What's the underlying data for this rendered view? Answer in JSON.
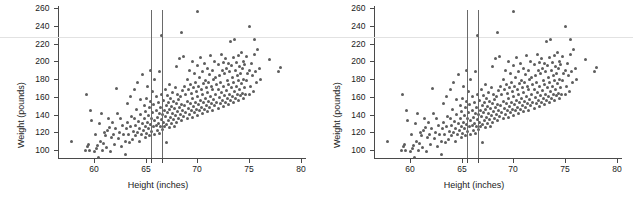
{
  "figure": {
    "width": 633,
    "height": 204,
    "background": "#ffffff",
    "page_rule": {
      "y_value": 227,
      "color": "#e2e2e2"
    }
  },
  "panels": [
    {
      "name": "panel-left",
      "x_offset": 0
    },
    {
      "name": "panel-right",
      "x_offset": 316
    }
  ],
  "chart_data": {
    "type": "scatter",
    "title": "",
    "xlabel": "Height (inches)",
    "ylabel": "Weight (pounds)",
    "xlim": [
      56.8,
      80.5
    ],
    "ylim": [
      88,
      266
    ],
    "xticks": [
      60,
      65,
      70,
      75,
      80
    ],
    "xticklabels": [
      "60",
      "65",
      "70",
      "75",
      "80"
    ],
    "yticks": [
      100,
      120,
      140,
      160,
      180,
      200,
      220,
      240,
      260
    ],
    "yticklabels": [
      "100",
      "120",
      "140",
      "160",
      "180",
      "200",
      "220",
      "240",
      "260"
    ],
    "grid": false,
    "legend": null,
    "marker_color": "#5d5d5d",
    "marker_size_px": 3,
    "annotations": [
      {
        "type": "vline",
        "x": 65.5,
        "color": "#6a6a6a",
        "label": "reference line 65.5 in"
      },
      {
        "type": "vline",
        "x": 66.6,
        "color": "#6a6a6a",
        "label": "reference line 66.6 in"
      },
      {
        "type": "hline",
        "y": 227,
        "color": "#e2e2e2",
        "label": "page rule"
      }
    ],
    "n_points": 300,
    "points": [
      [
        57.8,
        110
      ],
      [
        59.2,
        100
      ],
      [
        59.3,
        162
      ],
      [
        59.4,
        104
      ],
      [
        59.5,
        106
      ],
      [
        59.6,
        99
      ],
      [
        59.7,
        144
      ],
      [
        59.8,
        133
      ],
      [
        60.0,
        98
      ],
      [
        60.1,
        118
      ],
      [
        60.2,
        102
      ],
      [
        60.3,
        105
      ],
      [
        60.4,
        92
      ],
      [
        60.5,
        130
      ],
      [
        60.6,
        110
      ],
      [
        60.7,
        141
      ],
      [
        60.8,
        100
      ],
      [
        60.9,
        107
      ],
      [
        61.0,
        120
      ],
      [
        61.1,
        116
      ],
      [
        61.2,
        103
      ],
      [
        61.3,
        122
      ],
      [
        61.4,
        136
      ],
      [
        61.5,
        125
      ],
      [
        61.6,
        98
      ],
      [
        61.7,
        114
      ],
      [
        61.8,
        131
      ],
      [
        61.9,
        118
      ],
      [
        62.0,
        106
      ],
      [
        62.1,
        124
      ],
      [
        62.2,
        169
      ],
      [
        62.3,
        141
      ],
      [
        62.4,
        113
      ],
      [
        62.5,
        120
      ],
      [
        62.6,
        135
      ],
      [
        62.7,
        104
      ],
      [
        62.8,
        128
      ],
      [
        62.9,
        117
      ],
      [
        63.0,
        95
      ],
      [
        63.0,
        110
      ],
      [
        63.1,
        124
      ],
      [
        63.2,
        131
      ],
      [
        63.2,
        152
      ],
      [
        63.3,
        118
      ],
      [
        63.4,
        108
      ],
      [
        63.5,
        126
      ],
      [
        63.5,
        160
      ],
      [
        63.6,
        138
      ],
      [
        63.7,
        112
      ],
      [
        63.8,
        121
      ],
      [
        63.9,
        135
      ],
      [
        63.9,
        168
      ],
      [
        64.0,
        116
      ],
      [
        64.0,
        128
      ],
      [
        64.1,
        146
      ],
      [
        64.2,
        120
      ],
      [
        64.2,
        176
      ],
      [
        64.3,
        132
      ],
      [
        64.4,
        110
      ],
      [
        64.4,
        124
      ],
      [
        64.5,
        140
      ],
      [
        64.5,
        157
      ],
      [
        64.6,
        118
      ],
      [
        64.7,
        130
      ],
      [
        64.7,
        185
      ],
      [
        64.8,
        122
      ],
      [
        64.9,
        136
      ],
      [
        64.9,
        150
      ],
      [
        65.0,
        114
      ],
      [
        65.0,
        127
      ],
      [
        65.0,
        143
      ],
      [
        65.1,
        119
      ],
      [
        65.1,
        158
      ],
      [
        65.2,
        131
      ],
      [
        65.2,
        172
      ],
      [
        65.3,
        124
      ],
      [
        65.3,
        139
      ],
      [
        65.4,
        116
      ],
      [
        65.4,
        148
      ],
      [
        65.5,
        129
      ],
      [
        65.5,
        155
      ],
      [
        65.5,
        190
      ],
      [
        65.6,
        121
      ],
      [
        65.6,
        135
      ],
      [
        65.7,
        142
      ],
      [
        65.7,
        166
      ],
      [
        65.8,
        126
      ],
      [
        65.8,
        151
      ],
      [
        65.9,
        118
      ],
      [
        65.9,
        133
      ],
      [
        65.9,
        179
      ],
      [
        66.0,
        128
      ],
      [
        66.0,
        145
      ],
      [
        66.0,
        160
      ],
      [
        66.1,
        122
      ],
      [
        66.1,
        137
      ],
      [
        66.2,
        130
      ],
      [
        66.2,
        154
      ],
      [
        66.3,
        119
      ],
      [
        66.3,
        141
      ],
      [
        66.3,
        188
      ],
      [
        66.4,
        127
      ],
      [
        66.4,
        148
      ],
      [
        66.5,
        134
      ],
      [
        66.5,
        162
      ],
      [
        66.5,
        229
      ],
      [
        66.6,
        123
      ],
      [
        66.6,
        140
      ],
      [
        66.7,
        131
      ],
      [
        66.7,
        156
      ],
      [
        66.8,
        126
      ],
      [
        66.8,
        144
      ],
      [
        66.9,
        138
      ],
      [
        66.9,
        168
      ],
      [
        67.0,
        129
      ],
      [
        67.0,
        150
      ],
      [
        67.0,
        109
      ],
      [
        67.1,
        142
      ],
      [
        67.1,
        161
      ],
      [
        67.2,
        133
      ],
      [
        67.2,
        153
      ],
      [
        67.3,
        125
      ],
      [
        67.3,
        146
      ],
      [
        67.3,
        174
      ],
      [
        67.4,
        137
      ],
      [
        67.4,
        158
      ],
      [
        67.5,
        130
      ],
      [
        67.5,
        149
      ],
      [
        67.6,
        141
      ],
      [
        67.6,
        165
      ],
      [
        67.7,
        134
      ],
      [
        67.7,
        155
      ],
      [
        67.8,
        127
      ],
      [
        67.8,
        147
      ],
      [
        67.9,
        139
      ],
      [
        67.9,
        170
      ],
      [
        68.0,
        131
      ],
      [
        68.0,
        152
      ],
      [
        68.0,
        194
      ],
      [
        68.1,
        143
      ],
      [
        68.1,
        163
      ],
      [
        68.2,
        136
      ],
      [
        68.2,
        157
      ],
      [
        68.3,
        148
      ],
      [
        68.3,
        203
      ],
      [
        68.4,
        140
      ],
      [
        68.4,
        160
      ],
      [
        68.5,
        133
      ],
      [
        68.5,
        151
      ],
      [
        68.5,
        232
      ],
      [
        68.6,
        145
      ],
      [
        68.6,
        167
      ],
      [
        68.7,
        138
      ],
      [
        68.7,
        205
      ],
      [
        68.8,
        150
      ],
      [
        68.8,
        172
      ],
      [
        68.9,
        142
      ],
      [
        68.9,
        162
      ],
      [
        69.0,
        135
      ],
      [
        69.0,
        155
      ],
      [
        69.0,
        180
      ],
      [
        69.1,
        147
      ],
      [
        69.1,
        168
      ],
      [
        69.2,
        140
      ],
      [
        69.2,
        190
      ],
      [
        69.3,
        152
      ],
      [
        69.3,
        174
      ],
      [
        69.4,
        144
      ],
      [
        69.4,
        164
      ],
      [
        69.5,
        137
      ],
      [
        69.5,
        158
      ],
      [
        69.5,
        200
      ],
      [
        69.6,
        149
      ],
      [
        69.6,
        170
      ],
      [
        69.7,
        142
      ],
      [
        69.7,
        186
      ],
      [
        69.8,
        154
      ],
      [
        69.8,
        176
      ],
      [
        69.9,
        146
      ],
      [
        69.9,
        166
      ],
      [
        70.0,
        139
      ],
      [
        70.0,
        160
      ],
      [
        70.0,
        195
      ],
      [
        70.0,
        256
      ],
      [
        70.1,
        151
      ],
      [
        70.1,
        172
      ],
      [
        70.2,
        144
      ],
      [
        70.2,
        182
      ],
      [
        70.3,
        156
      ],
      [
        70.3,
        204
      ],
      [
        70.4,
        148
      ],
      [
        70.4,
        168
      ],
      [
        70.5,
        141
      ],
      [
        70.5,
        162
      ],
      [
        70.5,
        188
      ],
      [
        70.6,
        153
      ],
      [
        70.6,
        175
      ],
      [
        70.7,
        146
      ],
      [
        70.7,
        198
      ],
      [
        70.8,
        158
      ],
      [
        70.8,
        178
      ],
      [
        70.9,
        150
      ],
      [
        70.9,
        170
      ],
      [
        71.0,
        143
      ],
      [
        71.0,
        165
      ],
      [
        71.0,
        192
      ],
      [
        71.1,
        155
      ],
      [
        71.1,
        176
      ],
      [
        71.2,
        148
      ],
      [
        71.2,
        185
      ],
      [
        71.3,
        160
      ],
      [
        71.3,
        206
      ],
      [
        71.4,
        152
      ],
      [
        71.4,
        172
      ],
      [
        71.5,
        145
      ],
      [
        71.5,
        168
      ],
      [
        71.5,
        190
      ],
      [
        71.6,
        157
      ],
      [
        71.6,
        180
      ],
      [
        71.7,
        150
      ],
      [
        71.7,
        200
      ],
      [
        71.8,
        162
      ],
      [
        71.8,
        182
      ],
      [
        71.9,
        154
      ],
      [
        71.9,
        174
      ],
      [
        72.0,
        147
      ],
      [
        72.0,
        168
      ],
      [
        72.0,
        196
      ],
      [
        72.1,
        159
      ],
      [
        72.1,
        184
      ],
      [
        72.2,
        152
      ],
      [
        72.2,
        176
      ],
      [
        72.3,
        165
      ],
      [
        72.3,
        208
      ],
      [
        72.4,
        156
      ],
      [
        72.4,
        190
      ],
      [
        72.5,
        149
      ],
      [
        72.5,
        172
      ],
      [
        72.5,
        199
      ],
      [
        72.6,
        161
      ],
      [
        72.6,
        186
      ],
      [
        72.7,
        154
      ],
      [
        72.7,
        203
      ],
      [
        72.8,
        167
      ],
      [
        72.8,
        192
      ],
      [
        72.9,
        158
      ],
      [
        72.9,
        178
      ],
      [
        73.0,
        151
      ],
      [
        73.0,
        174
      ],
      [
        73.0,
        198
      ],
      [
        73.1,
        163
      ],
      [
        73.1,
        188
      ],
      [
        73.2,
        156
      ],
      [
        73.2,
        222
      ],
      [
        73.3,
        170
      ],
      [
        73.3,
        195
      ],
      [
        73.4,
        160
      ],
      [
        73.4,
        182
      ],
      [
        73.5,
        153
      ],
      [
        73.5,
        176
      ],
      [
        73.5,
        204
      ],
      [
        73.6,
        166
      ],
      [
        73.6,
        224
      ],
      [
        73.7,
        158
      ],
      [
        73.7,
        190
      ],
      [
        73.8,
        172
      ],
      [
        73.8,
        199
      ],
      [
        73.9,
        163
      ],
      [
        73.9,
        184
      ],
      [
        74.0,
        156
      ],
      [
        74.0,
        178
      ],
      [
        74.0,
        206
      ],
      [
        74.1,
        168
      ],
      [
        74.1,
        194
      ],
      [
        74.2,
        161
      ],
      [
        74.2,
        186
      ],
      [
        74.3,
        175
      ],
      [
        74.3,
        210
      ],
      [
        74.4,
        164
      ],
      [
        74.4,
        192
      ],
      [
        74.5,
        158
      ],
      [
        74.5,
        180
      ],
      [
        74.5,
        200
      ],
      [
        74.6,
        170
      ],
      [
        74.6,
        196
      ],
      [
        74.7,
        163
      ],
      [
        74.8,
        178
      ],
      [
        74.8,
        205
      ],
      [
        74.9,
        186
      ],
      [
        75.0,
        162
      ],
      [
        75.0,
        190
      ],
      [
        75.0,
        239
      ],
      [
        75.1,
        172
      ],
      [
        75.2,
        198
      ],
      [
        75.3,
        184
      ],
      [
        75.4,
        166
      ],
      [
        75.5,
        225
      ],
      [
        75.5,
        208
      ],
      [
        75.6,
        188
      ],
      [
        75.7,
        176
      ],
      [
        75.8,
        213
      ],
      [
        76.0,
        192
      ],
      [
        76.1,
        179
      ],
      [
        77.0,
        202
      ],
      [
        77.9,
        188
      ],
      [
        78.0,
        193
      ]
    ]
  }
}
